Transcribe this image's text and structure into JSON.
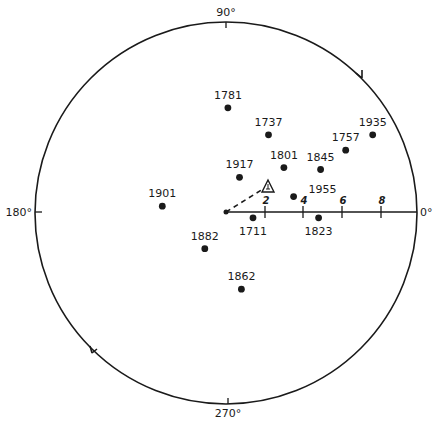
{
  "chart_data": {
    "type": "scatter",
    "projection": "polar",
    "title": "",
    "angle_labels": [
      "90°",
      "180°",
      "270°",
      "0°"
    ],
    "angle_ticks_deg": [
      0,
      90,
      180,
      270
    ],
    "radial_scale": {
      "ticks": [
        2,
        4,
        6,
        8
      ],
      "axis_direction_deg": 0,
      "max": 10
    },
    "direction_arrows": "counterclockwise",
    "center_marker": {
      "label": "",
      "symbol": "dot"
    },
    "mean_vector": {
      "symbol": "triangle",
      "label": "",
      "x": 2.2,
      "y": 1.4,
      "style": "dashed line from origin"
    },
    "points": [
      {
        "label": "1781",
        "x": 0.1,
        "y": 5.4
      },
      {
        "label": "1737",
        "x": 2.2,
        "y": 4.0
      },
      {
        "label": "1935",
        "x": 7.6,
        "y": 4.0
      },
      {
        "label": "1757",
        "x": 6.2,
        "y": 3.2
      },
      {
        "label": "1801",
        "x": 3.0,
        "y": 2.3
      },
      {
        "label": "1845",
        "x": 4.9,
        "y": 2.2
      },
      {
        "label": "1917",
        "x": 0.7,
        "y": 1.8
      },
      {
        "label": "1901",
        "x": -3.3,
        "y": 0.3
      },
      {
        "label": "1955",
        "x": 3.5,
        "y": 0.8
      },
      {
        "label": "1711",
        "x": 1.4,
        "y": -0.3
      },
      {
        "label": "1823",
        "x": 4.8,
        "y": -0.3
      },
      {
        "label": "1882",
        "x": -1.1,
        "y": -1.9
      },
      {
        "label": "1862",
        "x": 0.8,
        "y": -4.0
      }
    ]
  },
  "labels": {
    "deg90": "90°",
    "deg180": "180°",
    "deg270": "270°",
    "deg0": "0°",
    "tick2": "2",
    "tick4": "4",
    "tick6": "6",
    "tick8": "8"
  }
}
